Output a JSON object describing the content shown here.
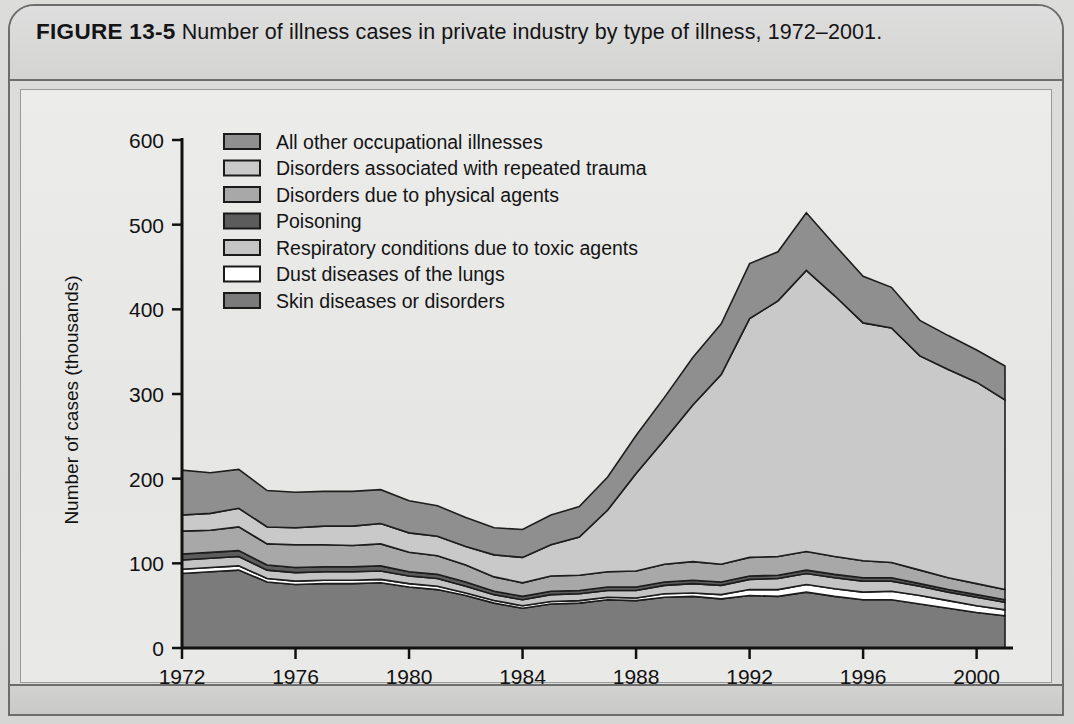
{
  "figure": {
    "number": "FIGURE 13-5",
    "caption": "Number of illness cases in private industry by type of illness, 1972–2001."
  },
  "chart_data": {
    "type": "area",
    "title": "Number of illness cases in private industry by type of illness, 1972–2001",
    "stacked": true,
    "xlabel": "",
    "ylabel": "Number of cases (thousands)",
    "xlim": [
      1972,
      2001
    ],
    "ylim": [
      0,
      600
    ],
    "yticks": [
      0,
      100,
      200,
      300,
      400,
      500,
      600
    ],
    "ytick_labels": [
      "0",
      "100",
      "200",
      "300",
      "400",
      "500",
      "600"
    ],
    "xticks": [
      1972,
      1976,
      1980,
      1984,
      1988,
      1992,
      1996,
      2000
    ],
    "xtick_labels": [
      "1972",
      "1976",
      "1980",
      "1984",
      "1988",
      "1992",
      "1996",
      "2000"
    ],
    "grid": false,
    "legend_position": "upper-left",
    "x": [
      1972,
      1973,
      1974,
      1975,
      1976,
      1977,
      1978,
      1979,
      1980,
      1981,
      1982,
      1983,
      1984,
      1985,
      1986,
      1987,
      1988,
      1989,
      1990,
      1991,
      1992,
      1993,
      1994,
      1995,
      1996,
      1997,
      1998,
      1999,
      2000,
      2001
    ],
    "series": [
      {
        "name": "Skin diseases or disorders",
        "color": "#7b7b7b",
        "values": [
          88,
          90,
          92,
          78,
          75,
          76,
          76,
          77,
          72,
          69,
          62,
          53,
          47,
          52,
          53,
          57,
          56,
          60,
          61,
          58,
          62,
          61,
          66,
          61,
          57,
          57,
          52,
          47,
          42,
          38
        ]
      },
      {
        "name": "Dust diseases of the lungs",
        "color": "#ffffff",
        "values": [
          5,
          5,
          5,
          4,
          4,
          4,
          4,
          4,
          4,
          4,
          3,
          3,
          3,
          3,
          3,
          3,
          3,
          4,
          4,
          5,
          7,
          8,
          9,
          9,
          9,
          10,
          10,
          9,
          8,
          7
        ]
      },
      {
        "name": "Respiratory conditions due to toxic agents",
        "color": "#c4c4c4",
        "values": [
          11,
          11,
          11,
          10,
          10,
          10,
          10,
          10,
          9,
          9,
          8,
          7,
          7,
          8,
          8,
          8,
          9,
          10,
          11,
          11,
          12,
          13,
          13,
          13,
          13,
          12,
          11,
          10,
          10,
          9
        ]
      },
      {
        "name": "Poisoning",
        "color": "#5c5c5c",
        "values": [
          7,
          7,
          7,
          6,
          6,
          6,
          6,
          6,
          5,
          5,
          5,
          4,
          4,
          4,
          4,
          4,
          4,
          4,
          4,
          4,
          4,
          4,
          4,
          4,
          4,
          4,
          3,
          3,
          3,
          3
        ]
      },
      {
        "name": "Disorders due to physical agents",
        "color": "#a8a8a8",
        "values": [
          27,
          26,
          28,
          25,
          27,
          26,
          25,
          26,
          23,
          22,
          20,
          17,
          16,
          18,
          18,
          18,
          19,
          21,
          22,
          21,
          22,
          22,
          22,
          21,
          20,
          18,
          16,
          14,
          13,
          12
        ]
      },
      {
        "name": "Disorders associated with repeated trauma",
        "color": "#c9c9c9",
        "values": [
          19,
          20,
          22,
          20,
          20,
          22,
          23,
          24,
          23,
          23,
          22,
          26,
          30,
          37,
          45,
          73,
          115,
          147,
          185,
          224,
          282,
          302,
          332,
          308,
          281,
          277,
          253,
          246,
          238,
          224
        ]
      },
      {
        "name": "All other occupational illnesses",
        "color": "#8f8f8f",
        "values": [
          53,
          48,
          46,
          43,
          42,
          41,
          41,
          40,
          38,
          36,
          34,
          32,
          33,
          35,
          36,
          39,
          45,
          50,
          56,
          60,
          65,
          58,
          68,
          60,
          55,
          48,
          42,
          40,
          38,
          40
        ]
      }
    ],
    "totals": [
      210,
      207,
      211,
      186,
      184,
      185,
      185,
      187,
      174,
      168,
      154,
      142,
      140,
      157,
      167,
      202,
      251,
      296,
      343,
      383,
      456,
      468,
      514,
      476,
      439,
      426,
      387,
      369,
      352,
      333
    ]
  },
  "legend": {
    "items": [
      {
        "label": "All other occupational illnesses",
        "color": "#8f8f8f"
      },
      {
        "label": "Disorders associated with repeated trauma",
        "color": "#c9c9c9"
      },
      {
        "label": "Disorders due to physical agents",
        "color": "#a8a8a8"
      },
      {
        "label": "Poisoning",
        "color": "#5c5c5c"
      },
      {
        "label": "Respiratory conditions due to toxic agents",
        "color": "#c4c4c4"
      },
      {
        "label": "Dust diseases of the lungs",
        "color": "#ffffff"
      },
      {
        "label": "Skin diseases or disorders",
        "color": "#7b7b7b"
      }
    ]
  },
  "axes": {
    "y_title": "Number of cases (thousands)",
    "y_ticks": [
      "600",
      "500",
      "400",
      "300",
      "200",
      "100",
      "0"
    ],
    "x_ticks": [
      "1972",
      "1976",
      "1980",
      "1984",
      "1988",
      "1992",
      "1996",
      "2000"
    ]
  }
}
